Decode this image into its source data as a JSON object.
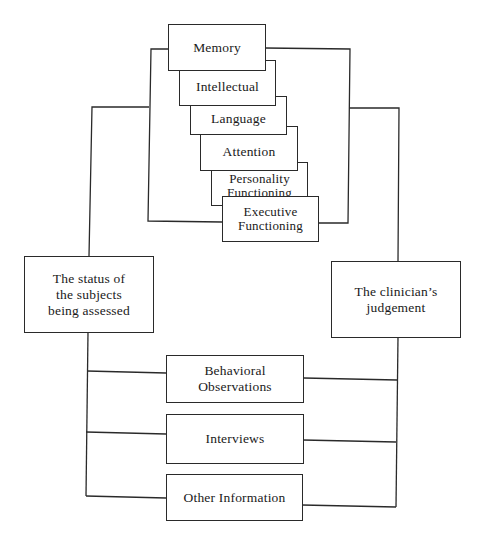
{
  "diagram": {
    "domains": [
      {
        "id": "memory",
        "label": "Memory"
      },
      {
        "id": "intellectual",
        "label": "Intellectual"
      },
      {
        "id": "language",
        "label": "Language"
      },
      {
        "id": "attention",
        "label": "Attention"
      },
      {
        "id": "personality",
        "label": "Personality\nFunctioning"
      },
      {
        "id": "executive",
        "label": "Executive\nFunctioning"
      }
    ],
    "left_node": {
      "label": "The status of\nthe subjects\nbeing assessed"
    },
    "right_node": {
      "label": "The clinician’s\njudgement"
    },
    "sources": [
      {
        "id": "behavioral",
        "label": "Behavioral\nObservations"
      },
      {
        "id": "interviews",
        "label": "Interviews"
      },
      {
        "id": "other",
        "label": "Other Information"
      }
    ],
    "colors": {
      "line": "#2a2a2a",
      "background": "#ffffff",
      "text": "#1a1a1a"
    }
  }
}
